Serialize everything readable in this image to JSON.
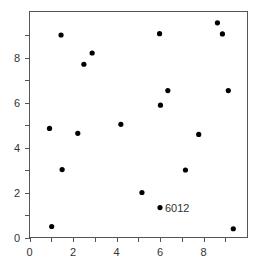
{
  "chart_data": {
    "type": "scatter",
    "title": "",
    "xlabel": "",
    "ylabel": "",
    "xlim": [
      0,
      10
    ],
    "ylim": [
      0,
      10
    ],
    "grid": false,
    "legend": null,
    "x_ticks": [
      0,
      2,
      4,
      6,
      8
    ],
    "y_ticks": [
      0,
      2,
      4,
      6,
      8
    ],
    "x_minor_ticks": [
      1,
      3,
      5,
      7,
      9
    ],
    "y_minor_ticks": [
      1,
      3,
      5,
      7,
      9
    ],
    "points": [
      {
        "x": 1.45,
        "y": 9.0
      },
      {
        "x": 2.88,
        "y": 8.2
      },
      {
        "x": 2.5,
        "y": 7.7
      },
      {
        "x": 5.98,
        "y": 9.06
      },
      {
        "x": 8.64,
        "y": 9.54
      },
      {
        "x": 8.87,
        "y": 9.05
      },
      {
        "x": 0.92,
        "y": 4.85
      },
      {
        "x": 2.22,
        "y": 4.63
      },
      {
        "x": 4.2,
        "y": 5.03
      },
      {
        "x": 1.5,
        "y": 3.02
      },
      {
        "x": 6.36,
        "y": 6.53
      },
      {
        "x": 6.02,
        "y": 5.88
      },
      {
        "x": 9.14,
        "y": 6.53
      },
      {
        "x": 7.78,
        "y": 4.58
      },
      {
        "x": 7.17,
        "y": 3.0
      },
      {
        "x": 1.02,
        "y": 0.49
      },
      {
        "x": 5.17,
        "y": 2.0
      },
      {
        "x": 6.0,
        "y": 1.33,
        "label": "6012"
      },
      {
        "x": 9.37,
        "y": 0.39
      }
    ],
    "annotations": [
      {
        "x": 6.0,
        "y": 1.33,
        "text": "6012"
      }
    ],
    "colors": {
      "marker": "#000000",
      "axis": "#555555",
      "text": "#333333",
      "background": "#ffffff"
    }
  }
}
